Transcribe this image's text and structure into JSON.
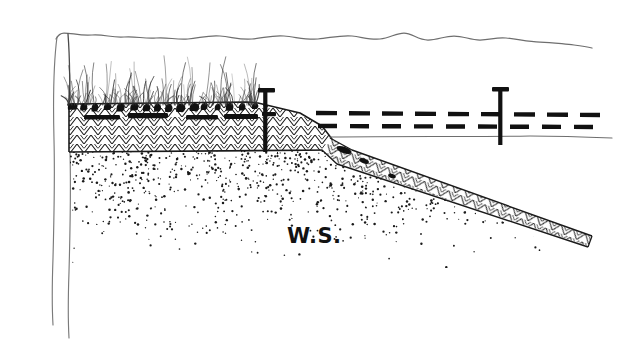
{
  "diagram": {
    "kind": "engineering-sketch",
    "background_color": "#ffffff",
    "ink_color": "#1a1a1a",
    "faint_ink_color": "#6e6e6e",
    "annotations": [
      {
        "id": "ws",
        "text": "W.S.",
        "meaning": "water surface",
        "x": 287,
        "y": 224,
        "font_size": 21,
        "color": "#121212"
      }
    ],
    "features": [
      {
        "name": "ground-surface-wavy-line",
        "style": "thin wavy gray line",
        "color": "#6e6e6e",
        "from_x": 55,
        "to_x": 592,
        "y": 36
      },
      {
        "name": "left-wall",
        "style": "two thin vertical gray lines",
        "color": "#6e6e6e",
        "x_outer": 52,
        "x_inner": 68,
        "top_y": 36,
        "bottom_y": 330
      },
      {
        "name": "revetment-band",
        "style": "herringbone chevron hatch",
        "color": "#1a1a1a",
        "left_x": 68,
        "right_x": 330,
        "top_y": 104,
        "bottom_y": 152
      },
      {
        "name": "grass-vegetation",
        "style": "thin tufts with dark root blobs",
        "color": "#1a1a1a",
        "from_x": 66,
        "to_x": 258,
        "base_y": 106
      },
      {
        "name": "stipple-soil",
        "style": "random dot stipple fading downward",
        "color": "#1a1a1a",
        "top_y": 150,
        "max_depth_y": 265
      },
      {
        "name": "diagonal-filter-band",
        "style": "herringbone chevron hatch, tapering",
        "color": "#1a1a1a",
        "start_x": 330,
        "start_y": 140,
        "end_x": 592,
        "end_y": 240
      },
      {
        "name": "water-surface-dashed-lines",
        "style": "two parallel heavy dashed lines",
        "color": "#111111",
        "from_x": 316,
        "to_x": 600,
        "upper_y": 113,
        "lower_y": 126
      },
      {
        "name": "water-line-thin",
        "style": "thin solid gray line",
        "color": "#6e6e6e",
        "from_x": 330,
        "to_x": 612,
        "y": 137
      }
    ],
    "markers": [
      {
        "name": "nail-marker-left",
        "type": "nail-pin",
        "x": 265,
        "head_y": 90,
        "tip_y": 152
      },
      {
        "name": "nail-marker-right",
        "type": "nail-pin",
        "x": 500,
        "head_y": 89,
        "tip_y": 143
      }
    ]
  }
}
